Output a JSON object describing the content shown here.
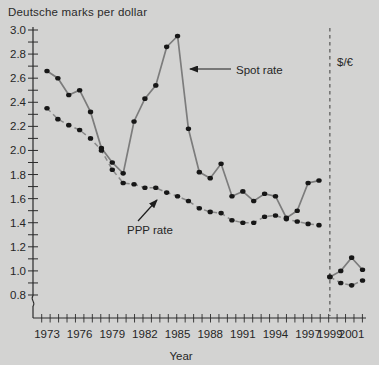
{
  "title": "Deutsche marks per dollar",
  "x_axis_title": "Year",
  "annotations": {
    "spot_label": "Spot rate",
    "ppp_label": "PPP rate",
    "euro_label": "$/€"
  },
  "chart_data": {
    "type": "line",
    "title": "Deutsche marks per dollar",
    "xlabel": "Year",
    "ylabel": "Deutsche marks per dollar",
    "ylim": [
      0.8,
      3.0
    ],
    "y_tick_step_minor": 0.1,
    "y_tick_labels": [
      "3.0",
      "2.8",
      "2.6",
      "2.4",
      "2.2",
      "2.0",
      "1.8",
      "1.6",
      "1.4",
      "1.2",
      "1.0",
      "0.8"
    ],
    "x_tick_years_labeled": [
      1973,
      1976,
      1979,
      1982,
      1985,
      1988,
      1991,
      1994,
      1997,
      1999,
      2001
    ],
    "x_range_years": [
      1973,
      2002
    ],
    "euro_divider_year": 1999,
    "axis_break_below": 0.8,
    "grid": false,
    "legend_position": "inline-annotations",
    "series": [
      {
        "name": "Spot rate (DM per dollar)",
        "style": "solid",
        "x": [
          1973,
          1974,
          1975,
          1976,
          1977,
          1978,
          1979,
          1980,
          1981,
          1982,
          1983,
          1984,
          1985,
          1986,
          1987,
          1988,
          1989,
          1990,
          1991,
          1992,
          1993,
          1994,
          1995,
          1996,
          1997,
          1998
        ],
        "values": [
          2.66,
          2.6,
          2.46,
          2.5,
          2.32,
          2.02,
          1.9,
          1.81,
          2.24,
          2.43,
          2.54,
          2.86,
          2.95,
          2.18,
          1.82,
          1.77,
          1.89,
          1.62,
          1.66,
          1.58,
          1.64,
          1.62,
          1.44,
          1.5,
          1.73,
          1.75
        ]
      },
      {
        "name": "PPP rate (DM per dollar)",
        "style": "dashed",
        "x": [
          1973,
          1974,
          1975,
          1976,
          1977,
          1978,
          1979,
          1980,
          1981,
          1982,
          1983,
          1984,
          1985,
          1986,
          1987,
          1988,
          1989,
          1990,
          1991,
          1992,
          1993,
          1994,
          1995,
          1996,
          1997,
          1998
        ],
        "values": [
          2.35,
          2.26,
          2.21,
          2.17,
          2.1,
          2.0,
          1.84,
          1.73,
          1.72,
          1.69,
          1.69,
          1.65,
          1.62,
          1.58,
          1.52,
          1.49,
          1.48,
          1.42,
          1.4,
          1.4,
          1.45,
          1.46,
          1.43,
          1.41,
          1.39,
          1.38
        ]
      },
      {
        "name": "Spot rate ($/€)",
        "style": "solid",
        "x": [
          1999,
          2000,
          2001,
          2002
        ],
        "values": [
          0.95,
          1.0,
          1.11,
          1.01
        ]
      },
      {
        "name": "PPP rate ($/€)",
        "style": "dashed",
        "x": [
          1999,
          2000,
          2001,
          2002
        ],
        "values": [
          0.95,
          0.9,
          0.88,
          0.92
        ]
      }
    ],
    "colors": {
      "background": "#d3d3d2",
      "axis": "#2b2b2b",
      "line": "#7c7c7c",
      "dashed_line": "#8a8a8a",
      "dots": "#171717",
      "divider": "#4a4a4a",
      "text": "#262626"
    }
  }
}
